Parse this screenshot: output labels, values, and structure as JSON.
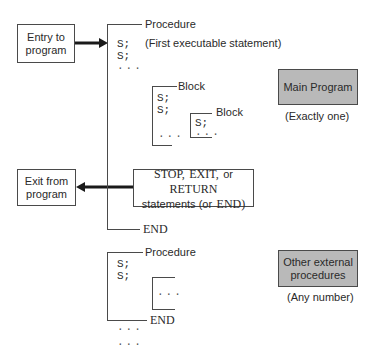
{
  "entry_box": {
    "line1": "Entry to",
    "line2": "program"
  },
  "exit_box": {
    "line1": "Exit from",
    "line2": "program"
  },
  "main_procedure": {
    "label": "Procedure",
    "stmt1": "S;",
    "stmt1_note": "(First executable statement)",
    "stmt2": "S;",
    "ellipsis": "...",
    "end_label": "END"
  },
  "block_outer": {
    "label": "Block",
    "stmt1": "S;",
    "stmt2": "S;",
    "ellipsis": "..."
  },
  "block_inner": {
    "label": "Block",
    "stmt1": "S;",
    "ellipsis": "..."
  },
  "exit_statements_box": {
    "kw_stop": "STOP,",
    "kw_exit": "EXIT,",
    "or1": "or",
    "kw_return": "RETURN",
    "line2_prefix": "statements (or",
    "kw_end": "END)"
  },
  "main_program_box": {
    "label": "Main Program",
    "caption": "(Exactly one)"
  },
  "other_procedure": {
    "label": "Procedure",
    "stmt1": "S;",
    "stmt2": "S;",
    "inner_ellipsis": "...",
    "end_label": "END",
    "trailing_ellipsis_1": "...",
    "trailing_ellipsis_2": "..."
  },
  "other_procedures_box": {
    "line1": "Other external",
    "line2": "procedures",
    "caption": "(Any number)"
  },
  "colors": {
    "line": "#4a4a4a",
    "gray_fill": "#b9b9b9",
    "arrow": "#1a1a1a"
  }
}
